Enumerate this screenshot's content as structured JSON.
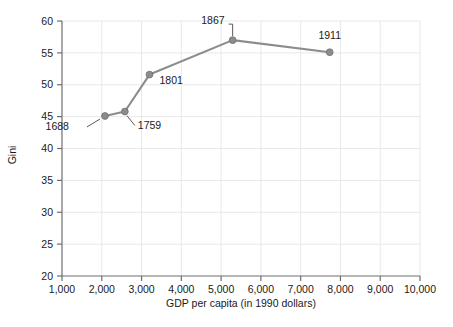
{
  "chart_data": {
    "type": "line",
    "title": "",
    "subtitle": "",
    "xlabel": "GDP per capita (in 1990 dollars)",
    "ylabel": "Gini",
    "xlim": [
      1000,
      10000
    ],
    "ylim": [
      20,
      60
    ],
    "xticks": [
      1000,
      2000,
      3000,
      4000,
      5000,
      6000,
      7000,
      8000,
      9000,
      10000
    ],
    "xtick_labels": [
      "1,000",
      "2,000",
      "3,000",
      "4,000",
      "5,000",
      "6,000",
      "7,000",
      "8,000",
      "9,000",
      "10,000"
    ],
    "yticks": [
      20,
      25,
      30,
      35,
      40,
      45,
      50,
      55,
      60
    ],
    "ytick_labels": [
      "20",
      "25",
      "30",
      "35",
      "40",
      "45",
      "50",
      "55",
      "60"
    ],
    "grid": true,
    "legend": "none",
    "series": [
      {
        "name": "Gini vs GDP per capita",
        "color": "#8c8c8c",
        "marker": "circle",
        "points": [
          {
            "label": "1688",
            "x": 2080,
            "y": 45.1
          },
          {
            "label": "1759",
            "x": 2580,
            "y": 45.8
          },
          {
            "label": "1801",
            "x": 3200,
            "y": 51.6
          },
          {
            "label": "1867",
            "x": 5290,
            "y": 57.0
          },
          {
            "label": "1911",
            "x": 7730,
            "y": 55.1
          }
        ]
      }
    ],
    "annotations": [
      {
        "text": "1688",
        "point_label": "1688",
        "placement": "below-left",
        "leader": true
      },
      {
        "text": "1759",
        "point_label": "1759",
        "placement": "below-right",
        "leader": true
      },
      {
        "text": "1801",
        "point_label": "1801",
        "placement": "right",
        "leader": false
      },
      {
        "text": "1867",
        "point_label": "1867",
        "placement": "above-left",
        "leader": true
      },
      {
        "text": "1911",
        "point_label": "1911",
        "placement": "above",
        "leader": false
      }
    ]
  },
  "style": {
    "series_color": "#8c8c8c",
    "axis_color": "#6e6e6e",
    "grid_color": "#e8e8ea",
    "text_color": "#1a1a1a",
    "background": "#ffffff"
  }
}
